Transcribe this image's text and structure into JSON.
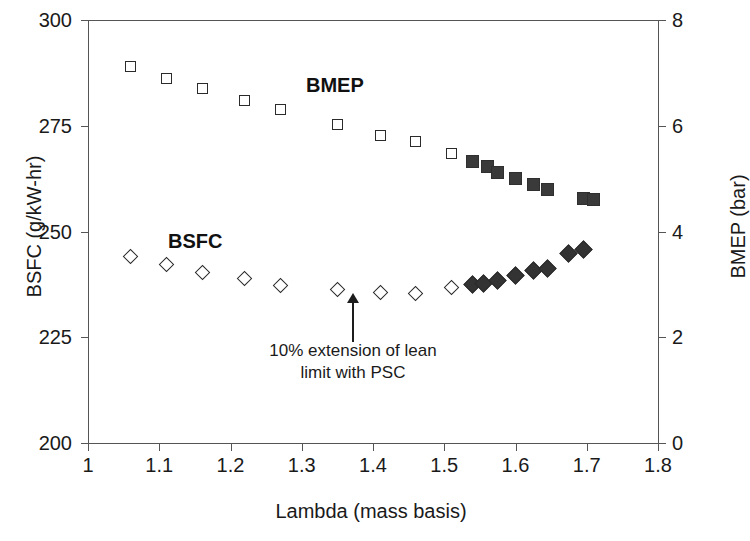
{
  "chart_data": {
    "type": "scatter",
    "title": "",
    "xlabel": "Lambda (mass basis)",
    "ylabel": "BSFC (g/kW-hr)",
    "y2label": "BMEP (bar)",
    "xlim": [
      1.0,
      1.8
    ],
    "ylim": [
      200,
      300
    ],
    "y2lim": [
      0,
      8
    ],
    "xticks": [
      "1",
      "1.1",
      "1.2",
      "1.3",
      "1.4",
      "1.5",
      "1.6",
      "1.7",
      "1.8"
    ],
    "xtick_values": [
      1.0,
      1.1,
      1.2,
      1.3,
      1.4,
      1.5,
      1.6,
      1.7,
      1.8
    ],
    "yticks_left": [
      "300",
      "275",
      "250",
      "225",
      "200"
    ],
    "ytick_left_values": [
      300,
      275,
      250,
      225,
      200
    ],
    "yticks_right": [
      "8",
      "6",
      "4",
      "2",
      "0"
    ],
    "ytick_right_values": [
      8,
      6,
      4,
      2,
      0
    ],
    "grid": false,
    "legend": "in-plot text labels",
    "series": [
      {
        "name": "BMEP",
        "axis": "right",
        "marker": "open-square",
        "unit": "bar",
        "x": [
          1.06,
          1.11,
          1.16,
          1.22,
          1.27,
          1.35,
          1.41,
          1.46,
          1.51
        ],
        "values": [
          7.13,
          6.9,
          6.7,
          6.48,
          6.3,
          6.02,
          5.82,
          5.7,
          5.48
        ]
      },
      {
        "name": "BMEP with PSC",
        "axis": "right",
        "marker": "filled-square",
        "unit": "bar",
        "x": [
          1.54,
          1.56,
          1.575,
          1.6,
          1.625,
          1.645,
          1.695,
          1.71
        ],
        "values": [
          5.32,
          5.22,
          5.12,
          5.0,
          4.88,
          4.8,
          4.62,
          4.6
        ]
      },
      {
        "name": "BSFC",
        "axis": "left",
        "marker": "open-diamond",
        "unit": "g/kW-hr",
        "x": [
          1.06,
          1.11,
          1.16,
          1.22,
          1.27,
          1.35,
          1.41,
          1.46,
          1.51
        ],
        "values": [
          244.0,
          242.2,
          240.3,
          239.0,
          237.3,
          236.2,
          235.5,
          235.3,
          236.8
        ]
      },
      {
        "name": "BSFC with PSC",
        "axis": "left",
        "marker": "filled-diamond",
        "unit": "g/kW-hr",
        "x": [
          1.54,
          1.555,
          1.575,
          1.6,
          1.625,
          1.645,
          1.675,
          1.695
        ],
        "values": [
          237.5,
          237.8,
          238.3,
          239.5,
          240.7,
          241.3,
          244.7,
          245.8
        ]
      }
    ],
    "annotations": [
      {
        "text_line1": "10% extension of lean",
        "text_line2": "limit with PSC",
        "points_to_x": 1.46,
        "arrow": "up"
      }
    ],
    "series_labels": [
      {
        "text": "BMEP",
        "x": 1.33,
        "y_right": 6.1
      },
      {
        "text": "BSFC",
        "x": 1.12,
        "y_left": 252
      }
    ],
    "colors": {
      "axis": "#555555",
      "text": "#1a1a1a",
      "marker_open_edge": "#2b2b2b",
      "marker_open_fill": "#ffffff",
      "marker_filled": "#363636"
    }
  }
}
